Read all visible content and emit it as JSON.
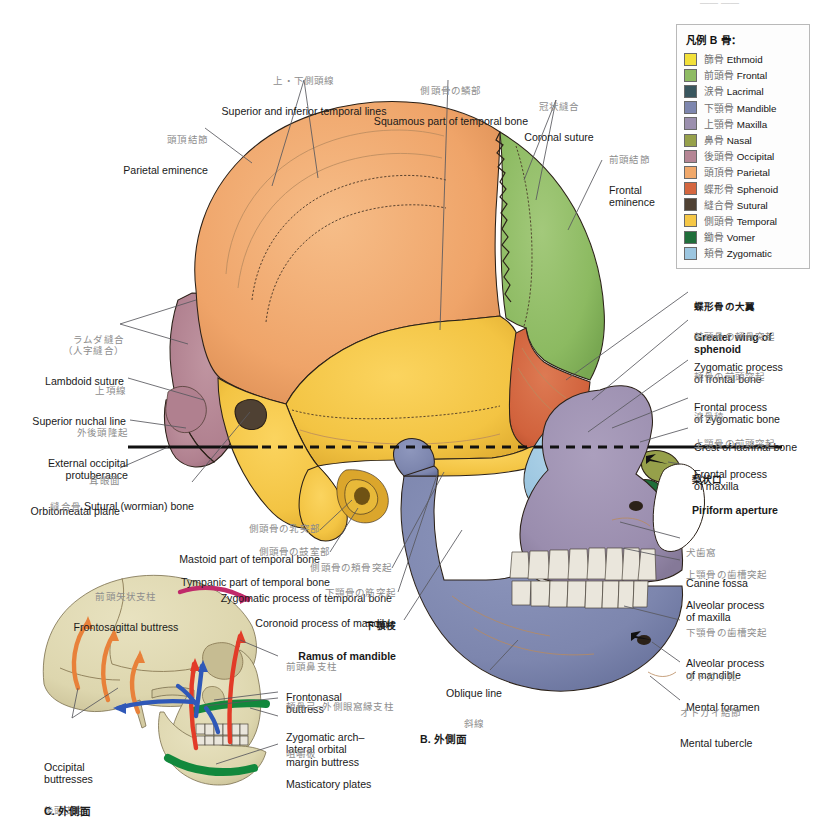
{
  "page": {
    "background": "#ffffff",
    "width": 813,
    "height": 815
  },
  "legend": {
    "title": "凡例 B  骨：",
    "items": [
      {
        "jp": "篩骨",
        "en": "Ethmoid",
        "color": "#f2e03a"
      },
      {
        "jp": "前頭骨",
        "en": "Frontal",
        "color": "#8ebb63"
      },
      {
        "jp": "涙骨",
        "en": "Lacrimal",
        "color": "#39565e"
      },
      {
        "jp": "下顎骨",
        "en": "Mandible",
        "color": "#7d86ae"
      },
      {
        "jp": "上顎骨",
        "en": "Maxilla",
        "color": "#9b8fae"
      },
      {
        "jp": "鼻骨",
        "en": "Nasal",
        "color": "#96a04a"
      },
      {
        "jp": "後頭骨",
        "en": "Occipital",
        "color": "#b58594"
      },
      {
        "jp": "頭頂骨",
        "en": "Parietal",
        "color": "#f0a86a"
      },
      {
        "jp": "蝶形骨",
        "en": "Sphenoid",
        "color": "#d4663f"
      },
      {
        "jp": "縫合骨",
        "en": "Sutural",
        "color": "#4f4133"
      },
      {
        "jp": "側頭骨",
        "en": "Temporal",
        "color": "#f5c746"
      },
      {
        "jp": "鋤骨",
        "en": "Vomer",
        "color": "#1f6e3a"
      },
      {
        "jp": "頬骨",
        "en": "Zygomatic",
        "color": "#9cc6e0"
      }
    ]
  },
  "figures": {
    "b_caption": "B.  外側面",
    "c_caption": "C.  外側面"
  },
  "labels_main": [
    {
      "id": "parietal-eminence",
      "jp": "頭頂結節",
      "en": "Parietal eminence"
    },
    {
      "id": "temporal-lines",
      "jp": "上・下側頭線",
      "en": "Superior and inferior temporal lines"
    },
    {
      "id": "squamous-part-temporal",
      "jp": "側頭骨の鱗部",
      "en": "Squamous part of temporal bone"
    },
    {
      "id": "coronal-suture",
      "jp": "冠状縫合",
      "en": "Coronal suture"
    },
    {
      "id": "frontal-eminence",
      "jp": "前頭結節",
      "en": "Frontal\neminence"
    },
    {
      "id": "lambdoid-suture",
      "jp": "ラムダ縫合\n（人字縫合）",
      "en": "Lambdoid suture"
    },
    {
      "id": "superior-nuchal-line",
      "jp": "上項線",
      "en": "Superior nuchal line"
    },
    {
      "id": "external-occipital-protuberance",
      "jp": "外後頭隆起",
      "en": "External occipital\nprotuberance"
    },
    {
      "id": "orbitomeatal-plane",
      "jp": "耳眼面",
      "en": "Orbitomeatal plane"
    },
    {
      "id": "sutural-bone",
      "jp": "縫合骨",
      "en": "Sutural (wormian) bone"
    },
    {
      "id": "mastoid-part-temporal",
      "jp": "側頭骨の乳突部",
      "en": "Mastoid part of temporal bone"
    },
    {
      "id": "tympanic-part-temporal",
      "jp": "側頭骨の鼓室部",
      "en": "Tympanic part of temporal bone"
    },
    {
      "id": "zygomatic-process-temporal",
      "jp": "側頭骨の頬骨突起",
      "en": "Zygomatic process of temporal bone"
    },
    {
      "id": "coronoid-process-mandible",
      "jp": "下顎骨の筋突起",
      "en": "Coronoid process of mandible"
    },
    {
      "id": "ramus-of-mandible",
      "jp": "下顎枝",
      "en": "Ramus of mandible"
    },
    {
      "id": "oblique-line",
      "jp": "斜線",
      "en": "Oblique line"
    }
  ],
  "labels_right": [
    {
      "id": "greater-wing-sphenoid",
      "jp": "蝶形骨の大翼",
      "en": "Greater wing of\nsphenoid",
      "bold": true
    },
    {
      "id": "zygomatic-process-frontal",
      "jp": "前頭骨の頬骨突起",
      "en": "Zygomatic process\nof frontal bone"
    },
    {
      "id": "frontal-process-zygomatic",
      "jp": "頬骨の前頭突起",
      "en": "Frontal process\nof zygomatic bone"
    },
    {
      "id": "crest-of-lacrimal-bone",
      "jp": "涙骨稜",
      "en": "Crest of lacrimal bone"
    },
    {
      "id": "frontal-process-maxilla",
      "jp": "上顎骨の前頭突起",
      "en": "Frontal process\nof maxilla"
    },
    {
      "id": "piriform-aperture",
      "jp": "梨状口",
      "en": "Piriform aperture",
      "bold": true
    },
    {
      "id": "canine-fossa",
      "jp": "犬歯窩",
      "en": "Canine fossa"
    },
    {
      "id": "alveolar-process-maxilla",
      "jp": "上顎骨の歯槽突起",
      "en": "Alveolar process\nof maxilla"
    },
    {
      "id": "alveolar-process-mandible",
      "jp": "下顎骨の歯槽突起",
      "en": "Alveolar process\nof mandible"
    },
    {
      "id": "mental-foramen",
      "jp": "オトガイ孔",
      "en": "Mental foramen"
    },
    {
      "id": "mental-tubercle",
      "jp": "オトガイ結節",
      "en": "Mental tubercle"
    }
  ],
  "labels_buttress": [
    {
      "id": "frontosagittal-buttress",
      "jp": "前頭矢状支柱",
      "en": "Frontosagittal buttress"
    },
    {
      "id": "frontonasal-buttress",
      "jp": "前頭鼻支柱",
      "en": "Frontonasal\nbuttress"
    },
    {
      "id": "zygomatic-arch-buttress",
      "jp": "頬骨弓−外側眼窩縁支柱",
      "en": "Zygomatic arch–\nlateral orbital\nmargin buttress"
    },
    {
      "id": "masticatory-plates",
      "jp": "咀嚼板",
      "en": "Masticatory plates"
    },
    {
      "id": "occipital-buttresses",
      "jp": "後頭支柱",
      "en": "Occipital\nbuttresses"
    }
  ],
  "colors": {
    "parietal": "#f0a86a",
    "frontal": "#8ebb63",
    "temporal": "#f5c746",
    "occipital": "#b58594",
    "sphenoid": "#d4663f",
    "zygomatic": "#9cc6e0",
    "maxilla": "#9b8fae",
    "mandible": "#7d86ae",
    "lacrimal": "#39565e",
    "nasal": "#96a04a",
    "ethmoid": "#f2e03a",
    "vomer": "#1f6e3a",
    "sutural": "#4f4133",
    "teeth": "#eae6dc",
    "small_skull_bone": "#ddd6ae",
    "arrow_orange": "#e8813a",
    "arrow_red": "#e23b28",
    "arrow_blue": "#2f58b8",
    "arrow_magenta": "#c02a6a",
    "plate_green": "#12883c"
  }
}
